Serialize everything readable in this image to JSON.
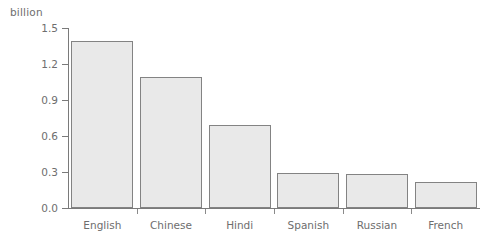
{
  "chart_data": {
    "type": "bar",
    "title": "",
    "subtitle": "",
    "unit_label": "billion",
    "xlabel": "",
    "ylabel": "",
    "ylim": [
      0.0,
      1.5
    ],
    "yticks": [
      "0.0",
      "0.3",
      "0.6",
      "0.9",
      "1.2",
      "1.5"
    ],
    "ytick_values": [
      0.0,
      0.3,
      0.6,
      0.9,
      1.2,
      1.5
    ],
    "grid": false,
    "legend": false,
    "categories": [
      "English",
      "Chinese",
      "Hindi",
      "Spanish",
      "Russian",
      "French"
    ],
    "values": [
      1.39,
      1.09,
      0.69,
      0.29,
      0.28,
      0.22
    ],
    "colors": {
      "bar_fill": "#e9e9e9",
      "bar_edge": "#838383",
      "axis": "#7a7a7a",
      "text": "#6e6e6e",
      "background": "#ffffff"
    }
  }
}
